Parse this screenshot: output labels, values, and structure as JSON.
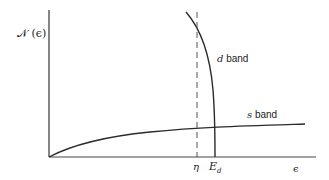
{
  "diagram": {
    "ylabel": "𝒩 (ϵ)",
    "xlabel": "ϵ",
    "curves": [
      {
        "name": "d band",
        "label_prefix": "d",
        "label_suffix": " band"
      },
      {
        "name": "s band",
        "label_prefix": "s",
        "label_suffix": " band"
      }
    ],
    "markers": {
      "eta": "η",
      "ed_main": "E",
      "ed_sub": "d"
    },
    "colors": {
      "line": "#2a2a2a",
      "dashed": "#555555"
    }
  }
}
